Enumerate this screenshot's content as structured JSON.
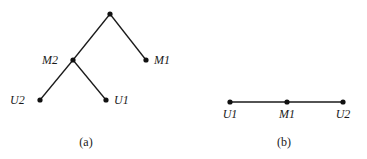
{
  "diagrams": [
    {
      "id": "a",
      "caption": "(a)",
      "type": "tree",
      "nodes": [
        {
          "id": "root",
          "label": "",
          "x": 110,
          "y": 14
        },
        {
          "id": "M2",
          "label": "M2",
          "x": 73,
          "y": 60,
          "label_x": 42,
          "label_y": 64,
          "anchor": "start"
        },
        {
          "id": "M1",
          "label": "M1",
          "x": 146,
          "y": 60,
          "label_x": 154,
          "label_y": 64,
          "anchor": "start"
        },
        {
          "id": "U2",
          "label": "U2",
          "x": 40,
          "y": 100,
          "label_x": 10,
          "label_y": 104,
          "anchor": "start"
        },
        {
          "id": "U1",
          "label": "U1",
          "x": 106,
          "y": 100,
          "label_x": 114,
          "label_y": 104,
          "anchor": "start"
        }
      ],
      "edges": [
        [
          "root",
          "M2"
        ],
        [
          "root",
          "M1"
        ],
        [
          "M2",
          "U2"
        ],
        [
          "M2",
          "U1"
        ]
      ],
      "caption_x": 86,
      "caption_y": 146
    },
    {
      "id": "b",
      "caption": "(b)",
      "type": "path",
      "nodes": [
        {
          "id": "U1",
          "label": "U1",
          "x": 230,
          "y": 102,
          "label_x": 230,
          "label_y": 118,
          "anchor": "middle"
        },
        {
          "id": "M1",
          "label": "M1",
          "x": 287,
          "y": 102,
          "label_x": 287,
          "label_y": 118,
          "anchor": "middle"
        },
        {
          "id": "U2",
          "label": "U2",
          "x": 343,
          "y": 102,
          "label_x": 343,
          "label_y": 118,
          "anchor": "middle"
        }
      ],
      "edges": [
        [
          "U1",
          "M1"
        ],
        [
          "M1",
          "U2"
        ]
      ],
      "caption_x": 284,
      "caption_y": 146
    }
  ]
}
